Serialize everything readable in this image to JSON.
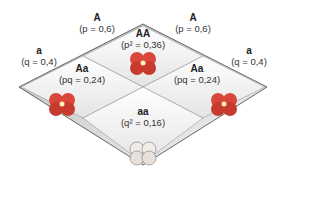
{
  "alleles_top": [
    {
      "allele": "A",
      "freq": "(p = 0,6)"
    },
    {
      "allele": "A",
      "freq": "(p = 0,6)"
    }
  ],
  "alleles_side": [
    {
      "allele": "a",
      "freq": "(q = 0,4)"
    },
    {
      "allele": "a",
      "freq": "(q = 0,4)"
    }
  ],
  "cells": [
    {
      "genotype": "AA",
      "freq": "(p² = 0,36)",
      "flower_color": "#d9473a"
    },
    {
      "genotype": "Aa",
      "freq": "(pq = 0,24)",
      "flower_color": "#d9473a"
    },
    {
      "genotype": "Aa",
      "freq": "(pq = 0,24)",
      "flower_color": "#d9473a"
    },
    {
      "genotype": "aa",
      "freq": "(q² = 0,16)",
      "flower_color": "#efe9e4"
    }
  ]
}
